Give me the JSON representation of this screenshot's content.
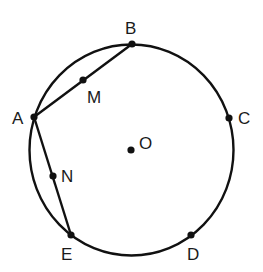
{
  "diagram": {
    "circle": {
      "center": "O"
    },
    "points": [
      {
        "id": "A",
        "label": "A",
        "on": "circle"
      },
      {
        "id": "B",
        "label": "B",
        "on": "circle"
      },
      {
        "id": "C",
        "label": "C",
        "on": "circle"
      },
      {
        "id": "D",
        "label": "D",
        "on": "circle"
      },
      {
        "id": "E",
        "label": "E",
        "on": "circle"
      },
      {
        "id": "M",
        "label": "M",
        "on": "segment AB"
      },
      {
        "id": "N",
        "label": "N",
        "on": "segment AE"
      },
      {
        "id": "O",
        "label": "O",
        "on": "center"
      }
    ],
    "segments": [
      {
        "from": "A",
        "to": "B"
      },
      {
        "from": "A",
        "to": "E"
      }
    ],
    "colors": {
      "stroke": "#111111",
      "text": "#1a1a1a",
      "background": "#ffffff"
    }
  }
}
